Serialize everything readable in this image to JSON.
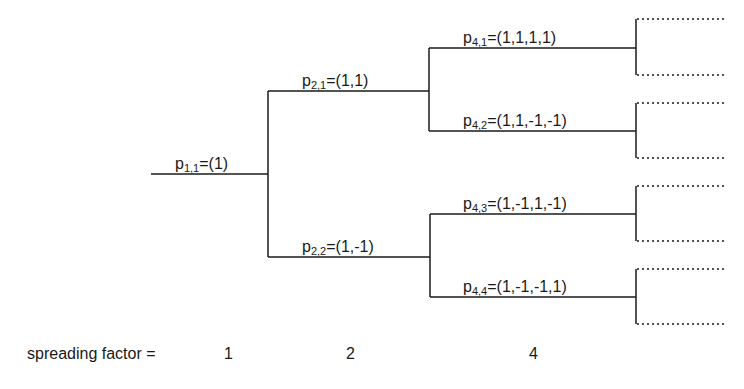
{
  "diagram": {
    "line_color": "#1a1a1a",
    "nodes": [
      {
        "id": "p11",
        "base": "p",
        "sub": "1,1",
        "value": "=(1)"
      },
      {
        "id": "p21",
        "base": "p",
        "sub": "2,1",
        "value": "=(1,1)"
      },
      {
        "id": "p22",
        "base": "p",
        "sub": "2,2",
        "value": "=(1,-1)"
      },
      {
        "id": "p41",
        "base": "p",
        "sub": "4,1",
        "value": "=(1,1,1,1)"
      },
      {
        "id": "p42",
        "base": "p",
        "sub": "4,2",
        "value": "=(1,1,-1,-1)"
      },
      {
        "id": "p43",
        "base": "p",
        "sub": "4,3",
        "value": "=(1,-1,1,-1)"
      },
      {
        "id": "p44",
        "base": "p",
        "sub": "4,4",
        "value": "=(1,-1,-1,1)"
      }
    ],
    "edges": [
      [
        "p11",
        "p21"
      ],
      [
        "p11",
        "p22"
      ],
      [
        "p21",
        "p41"
      ],
      [
        "p21",
        "p42"
      ],
      [
        "p22",
        "p43"
      ],
      [
        "p22",
        "p44"
      ]
    ],
    "continuation": "dotted branches to next level (not labeled)"
  },
  "spreading_factor": {
    "label": "spreading factor =",
    "values": [
      "1",
      "2",
      "4"
    ]
  }
}
